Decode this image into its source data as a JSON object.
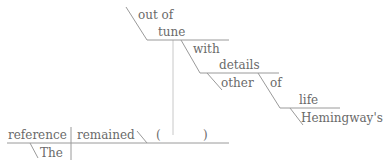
{
  "diagram": {
    "type": "reed-kellogg-sentence-diagram",
    "colors": {
      "text": "#6a6a6a",
      "line": "#9a9a9a",
      "faint_line": "#c8c8c8"
    },
    "subject": {
      "word": "reference",
      "modifiers": [
        "The"
      ]
    },
    "verb": {
      "word": "remained"
    },
    "complement": {
      "open_paren": "(",
      "close_paren": ")",
      "predicate_adjective": {
        "modifier_phrase": "out of",
        "word": "tune",
        "prepositional_phrase": {
          "preposition": "with",
          "object": "details",
          "object_modifiers": [
            "other"
          ],
          "nested_phrase": {
            "preposition": "of",
            "object": "life",
            "object_modifiers": [
              "Hemingway's"
            ]
          }
        }
      }
    }
  }
}
